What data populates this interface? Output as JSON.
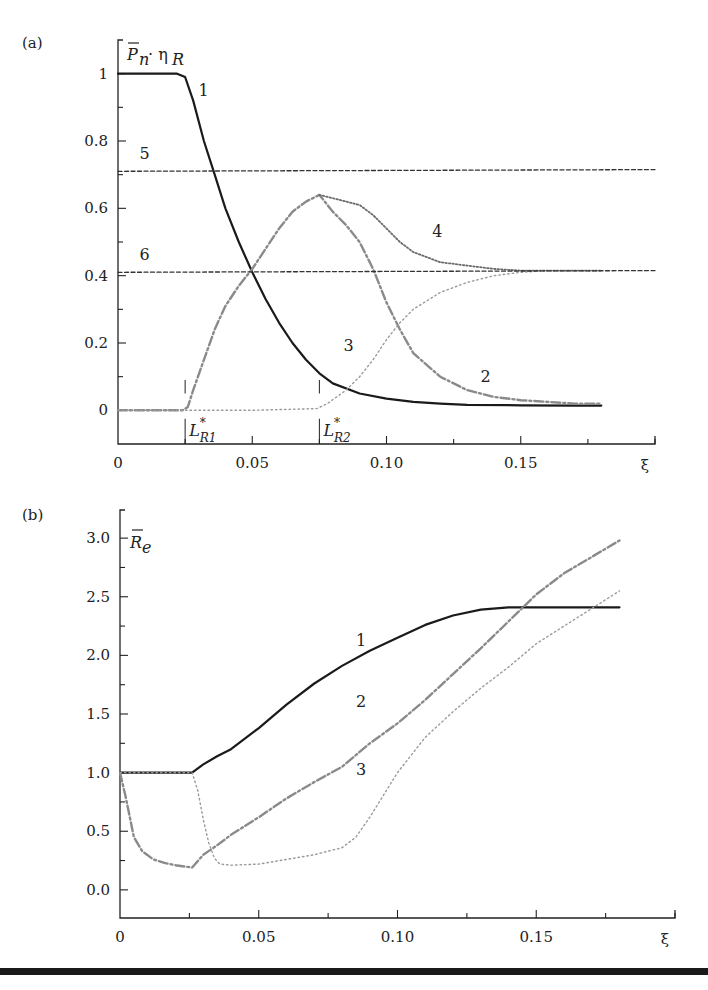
{
  "chart_data": [
    {
      "id": "a",
      "type": "line",
      "panel_label": "(a)",
      "ylabel": "P̄n · ηR",
      "ylabel_main": "P",
      "ylabel_sub": "n",
      "ylabel_mid": " · η",
      "ylabel_sub2": "R",
      "xlabel": "ξ",
      "xlim": [
        0,
        0.2
      ],
      "ylim": [
        -0.1,
        1.1
      ],
      "xticks": [
        0,
        0.05,
        0.1,
        0.15
      ],
      "xtick_labels": [
        "0",
        "0.05",
        "0.10",
        "0.15"
      ],
      "xminor": [
        0.025,
        0.075,
        0.125,
        0.175,
        0.2
      ],
      "yticks": [
        0,
        0.2,
        0.4,
        0.6,
        0.8,
        1
      ],
      "ytick_labels": [
        "0",
        "0.2",
        "0.4",
        "0.6",
        "0.8",
        "1"
      ],
      "yminor": [
        0.1,
        0.3,
        0.5,
        0.7,
        0.9
      ],
      "markers": [
        {
          "label": "L*R1",
          "main": "L",
          "sup": "*",
          "sub": "R1",
          "x": 0.025
        },
        {
          "label": "L*R2",
          "main": "L",
          "sup": "*",
          "sub": "R2",
          "x": 0.075
        }
      ],
      "series": [
        {
          "name": "1",
          "style": "solid",
          "color": "#1a1a1a",
          "x": [
            0,
            0.022,
            0.025,
            0.028,
            0.032,
            0.036,
            0.04,
            0.045,
            0.05,
            0.055,
            0.06,
            0.065,
            0.07,
            0.075,
            0.08,
            0.09,
            0.1,
            0.11,
            0.12,
            0.13,
            0.15,
            0.17,
            0.18
          ],
          "y": [
            1,
            1,
            0.99,
            0.92,
            0.8,
            0.7,
            0.6,
            0.5,
            0.41,
            0.33,
            0.26,
            0.2,
            0.15,
            0.11,
            0.08,
            0.05,
            0.035,
            0.025,
            0.02,
            0.016,
            0.015,
            0.014,
            0.014
          ],
          "label_at": [
            0.03,
            0.95
          ]
        },
        {
          "name": "2",
          "style": "dashdot",
          "color": "#8a8a8a",
          "x": [
            0,
            0.024,
            0.026,
            0.028,
            0.032,
            0.036,
            0.04,
            0.045,
            0.05,
            0.055,
            0.06,
            0.065,
            0.07,
            0.075,
            0.08,
            0.085,
            0.09,
            0.095,
            0.1,
            0.105,
            0.11,
            0.12,
            0.13,
            0.14,
            0.15,
            0.16,
            0.17,
            0.18
          ],
          "y": [
            0,
            0,
            0.01,
            0.06,
            0.15,
            0.24,
            0.31,
            0.37,
            0.42,
            0.48,
            0.54,
            0.59,
            0.62,
            0.64,
            0.59,
            0.55,
            0.5,
            0.42,
            0.32,
            0.24,
            0.17,
            0.1,
            0.06,
            0.04,
            0.03,
            0.025,
            0.02,
            0.02
          ],
          "label_at": [
            0.135,
            0.1
          ]
        },
        {
          "name": "3",
          "style": "dotted",
          "color": "#9a9a9a",
          "x": [
            0,
            0.025,
            0.05,
            0.074,
            0.078,
            0.085,
            0.09,
            0.095,
            0.1,
            0.105,
            0.11,
            0.12,
            0.13,
            0.14,
            0.15,
            0.16,
            0.17,
            0.18
          ],
          "y": [
            0,
            0,
            0,
            0.005,
            0.02,
            0.06,
            0.1,
            0.15,
            0.21,
            0.26,
            0.3,
            0.35,
            0.38,
            0.4,
            0.41,
            0.415,
            0.415,
            0.415
          ],
          "label_at": [
            0.084,
            0.19
          ]
        },
        {
          "name": "4",
          "style": "dotted-dense",
          "color": "#6a6a6a",
          "x": [
            0.075,
            0.08,
            0.085,
            0.09,
            0.095,
            0.1,
            0.105,
            0.11,
            0.12,
            0.13,
            0.14,
            0.15,
            0.16,
            0.17,
            0.18
          ],
          "y": [
            0.64,
            0.63,
            0.62,
            0.61,
            0.58,
            0.54,
            0.5,
            0.47,
            0.44,
            0.43,
            0.42,
            0.415,
            0.415,
            0.415,
            0.415
          ],
          "label_at": [
            0.117,
            0.53
          ]
        },
        {
          "name": "5",
          "style": "dashed",
          "color": "#333333",
          "x": [
            0,
            0.2
          ],
          "y": [
            0.71,
            0.715
          ],
          "label_at": [
            0.008,
            0.76
          ]
        },
        {
          "name": "6",
          "style": "dashed",
          "color": "#333333",
          "x": [
            0,
            0.2
          ],
          "y": [
            0.41,
            0.415
          ],
          "label_at": [
            0.008,
            0.46
          ]
        }
      ]
    },
    {
      "id": "b",
      "type": "line",
      "panel_label": "(b)",
      "ylabel": "R̄e",
      "ylabel_main": "R",
      "ylabel_sub": "e",
      "xlabel": "ξ",
      "xlim": [
        0,
        0.2
      ],
      "ylim": [
        -0.24,
        3.24
      ],
      "xticks": [
        0,
        0.05,
        0.1,
        0.15
      ],
      "xtick_labels": [
        "0",
        "0.05",
        "0.10",
        "0.15"
      ],
      "xminor": [
        0.025,
        0.075,
        0.125,
        0.175,
        0.2
      ],
      "yticks": [
        0,
        0.5,
        1.0,
        1.5,
        2.0,
        2.5,
        3.0
      ],
      "ytick_labels": [
        "0.0",
        "0.5",
        "1.0",
        "1.5",
        "2.0",
        "2.5",
        "3.0"
      ],
      "yminor": [
        0.25,
        0.75,
        1.25,
        1.75,
        2.25,
        2.75
      ],
      "series": [
        {
          "name": "1",
          "style": "solid",
          "color": "#1a1a1a",
          "x": [
            0,
            0.026,
            0.03,
            0.035,
            0.04,
            0.05,
            0.06,
            0.07,
            0.08,
            0.09,
            0.1,
            0.11,
            0.12,
            0.13,
            0.14,
            0.15,
            0.16,
            0.18
          ],
          "y": [
            1.0,
            1.0,
            1.07,
            1.14,
            1.2,
            1.38,
            1.58,
            1.76,
            1.91,
            2.04,
            2.15,
            2.26,
            2.34,
            2.39,
            2.41,
            2.41,
            2.41,
            2.41
          ],
          "label_at": [
            0.085,
            2.12
          ]
        },
        {
          "name": "2",
          "style": "dashdot",
          "color": "#8a8a8a",
          "x": [
            0,
            0.002,
            0.005,
            0.008,
            0.012,
            0.016,
            0.02,
            0.026,
            0.03,
            0.035,
            0.04,
            0.05,
            0.06,
            0.07,
            0.08,
            0.09,
            0.1,
            0.11,
            0.12,
            0.13,
            0.14,
            0.15,
            0.16,
            0.17,
            0.18
          ],
          "y": [
            1.0,
            0.8,
            0.45,
            0.33,
            0.26,
            0.23,
            0.21,
            0.19,
            0.3,
            0.38,
            0.47,
            0.62,
            0.78,
            0.92,
            1.05,
            1.25,
            1.42,
            1.62,
            1.84,
            2.06,
            2.29,
            2.52,
            2.7,
            2.84,
            2.98
          ],
          "label_at": [
            0.085,
            1.6
          ]
        },
        {
          "name": "3",
          "style": "dotted",
          "color": "#9a9a9a",
          "x": [
            0,
            0.026,
            0.028,
            0.03,
            0.032,
            0.034,
            0.036,
            0.04,
            0.05,
            0.06,
            0.07,
            0.08,
            0.085,
            0.09,
            0.1,
            0.11,
            0.12,
            0.13,
            0.14,
            0.15,
            0.16,
            0.17,
            0.18
          ],
          "y": [
            1.0,
            1.0,
            0.85,
            0.6,
            0.4,
            0.27,
            0.22,
            0.21,
            0.22,
            0.26,
            0.3,
            0.36,
            0.45,
            0.62,
            1.0,
            1.3,
            1.52,
            1.72,
            1.9,
            2.1,
            2.25,
            2.4,
            2.55
          ],
          "label_at": [
            0.085,
            1.02
          ]
        }
      ]
    }
  ]
}
